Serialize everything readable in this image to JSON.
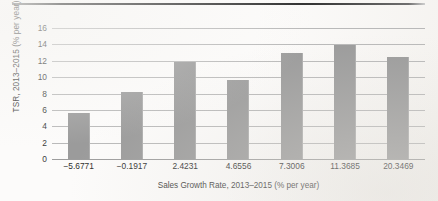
{
  "chart_data": {
    "type": "bar",
    "title": "",
    "xlabel": "Sales Growth Rate, 2013–2015 (% per year)",
    "ylabel": "TSR, 2013–2015 (% per year)",
    "categories": [
      "−5.6771",
      "−0.1917",
      "2.4231",
      "4.6556",
      "7.3006",
      "11.3685",
      "20.3469"
    ],
    "values": [
      5.6,
      8.2,
      11.8,
      9.7,
      13.0,
      13.9,
      12.4
    ],
    "ylim": [
      0,
      16
    ],
    "yticks": [
      "16",
      "14",
      "12",
      "10",
      "8",
      "6",
      "4",
      "2",
      "0"
    ],
    "ytick_values": [
      16,
      14,
      12,
      10,
      8,
      6,
      4,
      2,
      0
    ],
    "grid": true,
    "legend": "none",
    "bar_color": "#9b9b9b",
    "gridline_color": "#b9b9b9",
    "text_color": "#3b3b3b"
  },
  "page": {
    "background_color": "#fcfbfa",
    "rule_color": "#2f2f2f"
  }
}
